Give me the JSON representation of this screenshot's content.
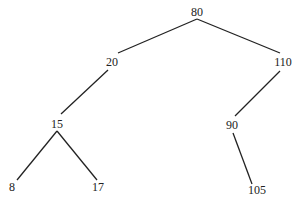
{
  "diagram": {
    "type": "binary-search-tree",
    "nodes": [
      {
        "id": "n80",
        "label": "80",
        "x": 197,
        "y": 12
      },
      {
        "id": "n20",
        "label": "20",
        "x": 112,
        "y": 62
      },
      {
        "id": "n110",
        "label": "110",
        "x": 283,
        "y": 62
      },
      {
        "id": "n15",
        "label": "15",
        "x": 57,
        "y": 124
      },
      {
        "id": "n90",
        "label": "90",
        "x": 232,
        "y": 125
      },
      {
        "id": "n8",
        "label": "8",
        "x": 12,
        "y": 187
      },
      {
        "id": "n17",
        "label": "17",
        "x": 98,
        "y": 187
      },
      {
        "id": "n105",
        "label": "105",
        "x": 257,
        "y": 190
      }
    ],
    "edges": [
      {
        "from": "80",
        "to": "20",
        "x1": 197,
        "y1": 19,
        "x2": 118,
        "y2": 53
      },
      {
        "from": "80",
        "to": "110",
        "x1": 197,
        "y1": 19,
        "x2": 280,
        "y2": 53
      },
      {
        "from": "20",
        "to": "15",
        "x1": 108,
        "y1": 70,
        "x2": 61,
        "y2": 114
      },
      {
        "from": "110",
        "to": "90",
        "x1": 280,
        "y1": 71,
        "x2": 235,
        "y2": 116
      },
      {
        "from": "15",
        "to": "8",
        "x1": 57,
        "y1": 131,
        "x2": 17,
        "y2": 180
      },
      {
        "from": "15",
        "to": "17",
        "x1": 57,
        "y1": 131,
        "x2": 97,
        "y2": 180
      },
      {
        "from": "90",
        "to": "105",
        "x1": 233,
        "y1": 133,
        "x2": 252,
        "y2": 184
      }
    ],
    "colors": {
      "line": "#222222",
      "text": "#222222"
    }
  }
}
